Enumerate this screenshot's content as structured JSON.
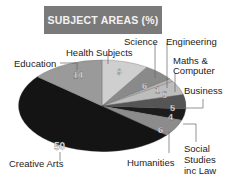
{
  "chart_data": {
    "type": "pie",
    "title": "SUBJECT AREAS (%)",
    "slices": [
      {
        "label": "Health Subjects",
        "value": 9,
        "color": "#cfcfcf"
      },
      {
        "label": "Science",
        "value": 6,
        "color": "#8a8a8a"
      },
      {
        "label": "Engineering",
        "value": 1,
        "color": "#b5b5b5"
      },
      {
        "label": "Maths & Computer",
        "value": 5,
        "color": "#bdbdbd"
      },
      {
        "label": "Business",
        "value": 5,
        "color": "#555555"
      },
      {
        "label": "Social Studies inc Law",
        "value": 4,
        "color": "#1c1c1c"
      },
      {
        "label": "Humanities",
        "value": 6,
        "color": "#8c8c8c"
      },
      {
        "label": "Creative Arts",
        "value": 50,
        "color": "#141414"
      },
      {
        "label": "Education",
        "value": 14,
        "color": "#9a9a9a"
      }
    ],
    "units": "%",
    "legend": "none (leader-line labels)"
  },
  "title": "SUBJECT AREAS (%)",
  "labels": {
    "health": "Health Subjects",
    "science": "Science",
    "engineering": "Engineering",
    "maths_1": "Maths &",
    "maths_2": "Computer",
    "business": "Business",
    "social_1": "Social",
    "social_2": "Studies",
    "social_3": "inc Law",
    "humanities": "Humanities",
    "creative": "Creative Arts",
    "education": "Education"
  },
  "values": {
    "health": "9",
    "science": "6",
    "engineering": "1",
    "maths": "5",
    "business": "5",
    "social": "4",
    "humanities": "6",
    "creative": "50",
    "education": "14"
  }
}
